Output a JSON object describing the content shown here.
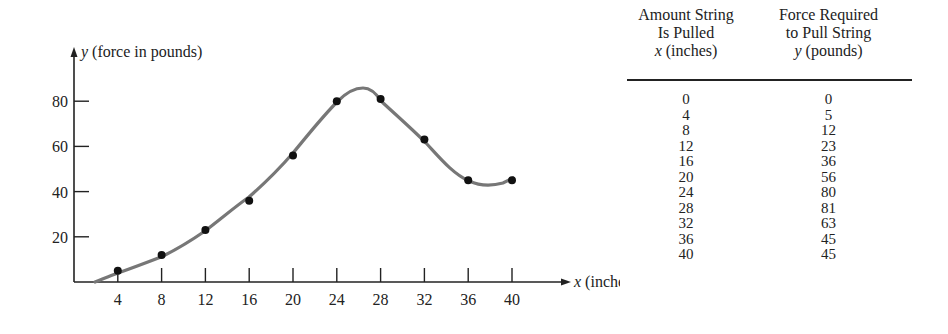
{
  "chart_data": {
    "type": "scatter",
    "title": "",
    "xlabel": "x (inches)",
    "ylabel": "y (force in pounds)",
    "x_ticks": [
      4,
      8,
      12,
      16,
      20,
      24,
      28,
      32,
      36,
      40
    ],
    "y_ticks": [
      20,
      40,
      60,
      80
    ],
    "xlim": [
      0,
      44
    ],
    "ylim": [
      0,
      95
    ],
    "grid": false,
    "legend": null,
    "series": [
      {
        "name": "Force vs. pull (data points)",
        "x": [
          4,
          8,
          12,
          16,
          20,
          24,
          28,
          32,
          36,
          40
        ],
        "y": [
          5,
          12,
          23,
          36,
          56,
          80,
          81,
          63,
          45,
          45
        ]
      }
    ],
    "fitted_curve": "smooth curve through points, peak ~84 at x≈26, local min ~43 at x≈38",
    "table": {
      "columns": [
        "Amount String Is Pulled x (inches)",
        "Force Required to Pull String y (pounds)"
      ],
      "rows": [
        [
          0,
          0
        ],
        [
          4,
          5
        ],
        [
          8,
          12
        ],
        [
          12,
          23
        ],
        [
          16,
          36
        ],
        [
          20,
          56
        ],
        [
          24,
          80
        ],
        [
          28,
          81
        ],
        [
          32,
          63
        ],
        [
          36,
          45
        ],
        [
          40,
          45
        ]
      ]
    }
  },
  "axes": {
    "y_label_var": "y",
    "y_label_rest": " (force in pounds)",
    "x_label_var": "x",
    "x_label_rest": " (inches)",
    "x_tick_labels": [
      "4",
      "8",
      "12",
      "16",
      "20",
      "24",
      "28",
      "32",
      "36",
      "40"
    ],
    "y_tick_labels": [
      "20",
      "40",
      "60",
      "80"
    ]
  },
  "table": {
    "col1_header": [
      "Amount String",
      "Is Pulled"
    ],
    "col1_var": "x",
    "col1_unit": " (inches)",
    "col2_header": [
      "Force Required",
      "to Pull String"
    ],
    "col2_var": "y",
    "col2_unit": " (pounds)",
    "rows": [
      {
        "x": "0",
        "y": "0"
      },
      {
        "x": "4",
        "y": "5"
      },
      {
        "x": "8",
        "y": "12"
      },
      {
        "x": "12",
        "y": "23"
      },
      {
        "x": "16",
        "y": "36"
      },
      {
        "x": "20",
        "y": "56"
      },
      {
        "x": "24",
        "y": "80"
      },
      {
        "x": "28",
        "y": "81"
      },
      {
        "x": "32",
        "y": "63"
      },
      {
        "x": "36",
        "y": "45"
      },
      {
        "x": "40",
        "y": "45"
      }
    ]
  }
}
